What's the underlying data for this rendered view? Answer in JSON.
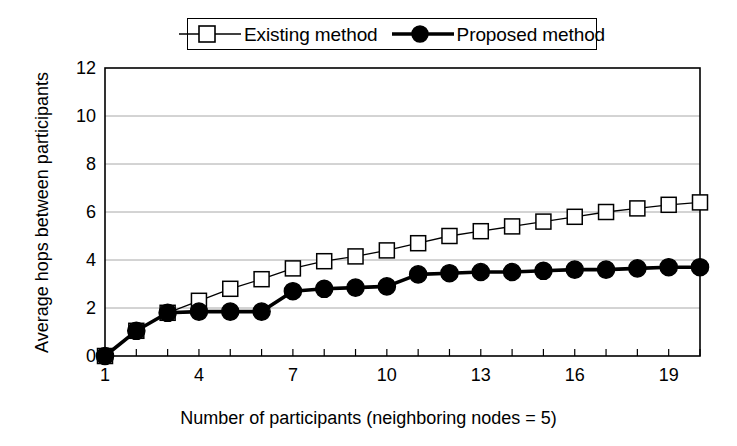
{
  "chart_data": {
    "type": "line",
    "title": "",
    "xlabel": "Number of participants (neighboring nodes = 5)",
    "ylabel": "Average hops between participants",
    "xlim": [
      1,
      20
    ],
    "ylim": [
      0,
      12
    ],
    "xticks": [
      1,
      4,
      7,
      10,
      13,
      16,
      19
    ],
    "xtick_labels": [
      "1",
      "4",
      "7",
      "10",
      "13",
      "16",
      "19"
    ],
    "yticks": [
      0,
      2,
      4,
      6,
      8,
      10,
      12
    ],
    "ytick_labels": [
      "0",
      "2",
      "4",
      "6",
      "8",
      "10",
      "12"
    ],
    "grid": "horizontal",
    "legend_position": "top-center",
    "x": [
      1,
      2,
      3,
      4,
      5,
      6,
      7,
      8,
      9,
      10,
      11,
      12,
      13,
      14,
      15,
      16,
      17,
      18,
      19,
      20
    ],
    "series": [
      {
        "name": "Existing method",
        "marker": "open-square",
        "color": "#000000",
        "values": [
          0.0,
          1.05,
          1.8,
          2.3,
          2.8,
          3.2,
          3.65,
          3.95,
          4.15,
          4.4,
          4.7,
          5.0,
          5.2,
          5.4,
          5.6,
          5.8,
          6.0,
          6.15,
          6.3,
          6.4
        ]
      },
      {
        "name": "Proposed method",
        "marker": "filled-circle",
        "color": "#000000",
        "values": [
          0.0,
          1.05,
          1.8,
          1.85,
          1.85,
          1.85,
          2.7,
          2.8,
          2.85,
          2.9,
          3.4,
          3.45,
          3.5,
          3.5,
          3.55,
          3.6,
          3.6,
          3.65,
          3.7,
          3.7
        ]
      }
    ]
  },
  "legend": {
    "entries": [
      {
        "label": "Existing method",
        "marker": "open-square"
      },
      {
        "label": "Proposed method",
        "marker": "filled-circle"
      }
    ]
  },
  "axes": {
    "x_title": "Number of participants (neighboring nodes = 5)",
    "y_title": "Average hops between participants"
  },
  "colors": {
    "line": "#000000",
    "grid": "#a8a8a8",
    "frame": "#000000",
    "background": "#ffffff"
  }
}
